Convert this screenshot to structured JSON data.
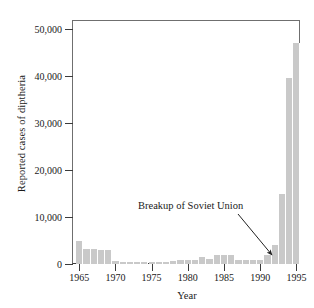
{
  "chart_data": {
    "type": "bar",
    "title": "",
    "xlabel": "Year",
    "ylabel": "Reported cases of diptheria",
    "xlim": [
      1964,
      1995.5
    ],
    "ylim": [
      0,
      52000
    ],
    "grid": false,
    "legend": null,
    "xticks": [
      "1965",
      "1970",
      "1975",
      "1980",
      "1985",
      "1990",
      "1995"
    ],
    "xtick_values": [
      1965,
      1970,
      1975,
      1980,
      1985,
      1990,
      1995
    ],
    "yticks": [
      "0",
      "10,000",
      "20,000",
      "30,000",
      "40,000",
      "50,000"
    ],
    "ytick_values": [
      0,
      10000,
      20000,
      30000,
      40000,
      50000
    ],
    "categories": [
      1965,
      1966,
      1967,
      1968,
      1969,
      1970,
      1971,
      1972,
      1973,
      1974,
      1975,
      1976,
      1977,
      1978,
      1979,
      1980,
      1981,
      1982,
      1983,
      1984,
      1985,
      1986,
      1987,
      1988,
      1989,
      1990,
      1991,
      1992,
      1993,
      1994,
      1995
    ],
    "values": [
      5000,
      3200,
      3100,
      3000,
      3000,
      600,
      500,
      450,
      420,
      400,
      380,
      360,
      400,
      700,
      750,
      800,
      900,
      1400,
      1000,
      1900,
      1900,
      1900,
      900,
      800,
      850,
      900,
      1900,
      4000,
      15000,
      39700,
      47000
    ],
    "annotations": [
      {
        "text": "Breakup of Soviet Union",
        "points_to_year": 1990,
        "points_to_value": 900
      }
    ],
    "bar_color": "#c9c9c9",
    "axis_color": "#3b3b3b"
  },
  "axis": {
    "y_title": "Reported cases of diptheria",
    "x_title": "Year"
  },
  "annotation": {
    "label": "Breakup of Soviet Union"
  }
}
